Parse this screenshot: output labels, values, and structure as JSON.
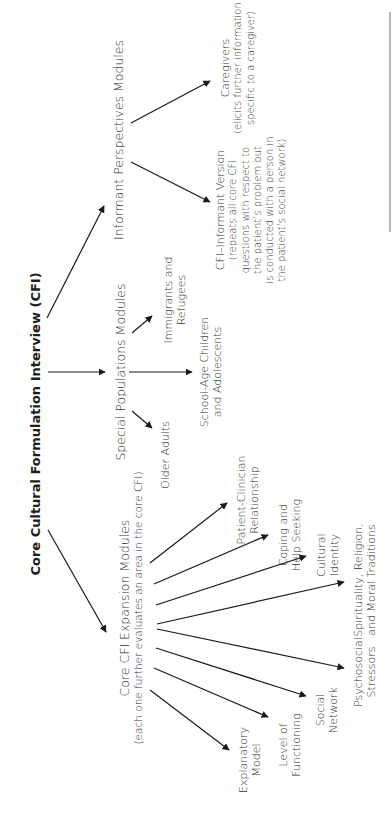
{
  "diagram": {
    "title": "Core Cultural Formulation Interview (CFI)",
    "branches": [
      {
        "label": "Informant Perspectives Modules",
        "children": [
          {
            "label": "CFI–Informant Version",
            "note_lines": [
              "(repeats all core CFI",
              "questions with respect to",
              "the patient’s problem but",
              "is conducted with a person in",
              "the patient’s social network)"
            ]
          },
          {
            "label": "Caregivers",
            "note_lines": [
              "(elicits further information",
              "specific to a caregiver)"
            ]
          }
        ]
      },
      {
        "label": "Special Populations Modules",
        "children": [
          {
            "lines": [
              "Older Adults"
            ]
          },
          {
            "lines": [
              "School-Age Children",
              "and Adolescents"
            ]
          },
          {
            "lines": [
              "Immigrants and",
              "Refugees"
            ]
          }
        ]
      },
      {
        "label": "Core CFI Expansion Modules",
        "sublabel": "(each one further evaluates an area in the core CFI)",
        "children": [
          {
            "lines": [
              "Explanatory",
              "Model"
            ]
          },
          {
            "lines": [
              "Level of",
              "Functioning"
            ]
          },
          {
            "lines": [
              "Social",
              "Network"
            ]
          },
          {
            "lines": [
              "Psychosocial",
              "Stressors"
            ]
          },
          {
            "lines": [
              "Spirituality, Religion,",
              "and Moral Traditions"
            ]
          },
          {
            "lines": [
              "Cultural",
              "Identity"
            ]
          },
          {
            "lines": [
              "Coping and",
              "Help Seeking"
            ]
          },
          {
            "lines": [
              "Patient-Clinician",
              "Relationship"
            ]
          }
        ]
      }
    ],
    "arrow_color": "#1a1a1a"
  }
}
